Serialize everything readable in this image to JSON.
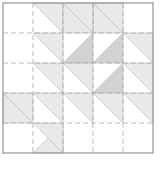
{
  "figure": {
    "name": "quilt-block-diagram",
    "title": "",
    "canvas": {
      "width": 161,
      "height": 179
    },
    "background_color": "#ffffff"
  },
  "chart_data": {
    "type": "heatmap",
    "title": "",
    "subtitle": "",
    "xlabel": "",
    "ylabel": "",
    "grid": true,
    "legend_position": "none",
    "block": {
      "rows": 5,
      "cols": 5,
      "cell_size": 30,
      "origin_x": 3,
      "origin_y": 3,
      "width": 150,
      "height": 150
    },
    "colors": {
      "light": "#e9e9e9",
      "medium": "#d2d2d2",
      "empty": "#ffffff",
      "triangle_stroke": "#b8b8b8",
      "frame_stroke": "#8a8a8a",
      "grid_stroke": "#a9a9a9"
    },
    "axis_ranges": {
      "x": [
        0,
        5
      ],
      "y": [
        0,
        5
      ]
    },
    "tick_labels": {
      "x": [
        "0",
        "1",
        "2",
        "3",
        "4",
        "5"
      ],
      "y": [
        "0",
        "1",
        "2",
        "3",
        "4",
        "5"
      ]
    },
    "legend": [
      {
        "label": "light patch",
        "color": "#e9e9e9"
      },
      {
        "label": "medium patch",
        "color": "#d2d2d2"
      },
      {
        "label": "background",
        "color": "#ffffff"
      }
    ],
    "cells": [
      [
        {
          "shade": "empty",
          "orient": "none"
        },
        {
          "shade": "light",
          "orient": "tr"
        },
        {
          "shade": "light",
          "orient": "bl"
        },
        {
          "shade": "light",
          "orient": "bl"
        },
        {
          "shade": "empty",
          "orient": "none"
        }
      ],
      [
        {
          "shade": "empty",
          "orient": "none"
        },
        {
          "shade": "light",
          "orient": "tr"
        },
        {
          "shade": "medium",
          "orient": "br"
        },
        {
          "shade": "medium",
          "orient": "br"
        },
        {
          "shade": "light",
          "orient": "tr"
        }
      ],
      [
        {
          "shade": "empty",
          "orient": "none"
        },
        {
          "shade": "light",
          "orient": "tr"
        },
        {
          "shade": "light",
          "orient": "tr"
        },
        {
          "shade": "medium",
          "orient": "br"
        },
        {
          "shade": "light",
          "orient": "tr"
        }
      ],
      [
        {
          "shade": "light",
          "orient": "tr"
        },
        {
          "shade": "light",
          "orient": "tr"
        },
        {
          "shade": "light",
          "orient": "tr"
        },
        {
          "shade": "light",
          "orient": "tr"
        },
        {
          "shade": "light",
          "orient": "tr"
        }
      ],
      [
        {
          "shade": "empty",
          "orient": "none"
        },
        {
          "shade": "light",
          "orient": "br"
        },
        {
          "shade": "empty",
          "orient": "none"
        },
        {
          "shade": "empty",
          "orient": "none"
        },
        {
          "shade": "empty",
          "orient": "none"
        }
      ]
    ],
    "extra_patches": [
      {
        "row": 0,
        "col": 2,
        "shade": "light",
        "orient": "tr"
      },
      {
        "row": 0,
        "col": 3,
        "shade": "light",
        "orient": "tr"
      },
      {
        "row": 3,
        "col": 0,
        "shade": "light",
        "orient": "bl"
      },
      {
        "row": 4,
        "col": 1,
        "shade": "light",
        "orient": "tr"
      }
    ],
    "grid_lines": {
      "vertical_dashed_x": [
        33,
        63,
        93,
        123
      ],
      "horizontal_dashed_y": [
        33,
        63,
        93,
        123
      ],
      "dash_pattern": "5,3"
    }
  }
}
